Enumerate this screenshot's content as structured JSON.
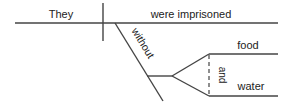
{
  "diagram": {
    "type": "sentence-diagram",
    "colors": {
      "line": "#444444",
      "text": "#222222",
      "background": "#ffffff"
    },
    "subject": "They",
    "predicate": "were imprisoned",
    "preposition": "without",
    "objects": [
      "food",
      "water"
    ],
    "conjunction": "and"
  }
}
